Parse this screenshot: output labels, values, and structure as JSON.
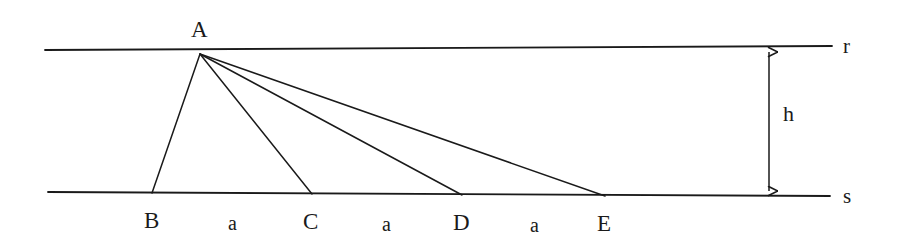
{
  "figure": {
    "stroke_color": "#1a1a1a",
    "background_color": "#ffffff",
    "apex": {
      "label": "A",
      "x": 200,
      "y": 54,
      "label_x": 191,
      "label_y": 18
    },
    "lines": [
      {
        "name": "line-r",
        "label": "r",
        "x1": 45,
        "y1": 50,
        "x2": 832,
        "y2": 46,
        "label_x": 843,
        "label_y": 36
      },
      {
        "name": "line-s",
        "label": "s",
        "x1": 48,
        "y1": 192,
        "x2": 830,
        "y2": 196,
        "label_x": 843,
        "label_y": 186
      }
    ],
    "base_points": [
      {
        "label": "B",
        "x": 152,
        "y": 193,
        "label_x": 144,
        "label_y": 209
      },
      {
        "label": "C",
        "x": 312,
        "y": 194,
        "label_x": 303,
        "label_y": 210
      },
      {
        "label": "D",
        "x": 462,
        "y": 195,
        "label_x": 453,
        "label_y": 211
      },
      {
        "label": "E",
        "x": 605,
        "y": 196,
        "label_x": 597,
        "label_y": 212
      }
    ],
    "segment_labels": [
      {
        "label": "a",
        "x": 228,
        "y": 213
      },
      {
        "label": "a",
        "x": 382,
        "y": 214
      },
      {
        "label": "a",
        "x": 530,
        "y": 215
      }
    ],
    "height_dimension": {
      "label": "h",
      "x": 769,
      "y_top": 48,
      "y_bottom": 195,
      "label_x": 783,
      "label_y": 103
    }
  }
}
